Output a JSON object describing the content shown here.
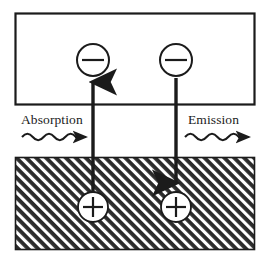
{
  "figure": {
    "width": 269,
    "height": 262,
    "background_color": "#ffffff",
    "ink_color": "#1b1b1b"
  },
  "regions": {
    "conduction_band": {
      "name": "conduction-band-box",
      "fill": "#ffffff",
      "stroke": "#1b1b1b",
      "x": 15,
      "y": 13,
      "width": 240,
      "height": 92
    },
    "valence_band": {
      "name": "valence-band-hatched",
      "fill": "#2b2b2b",
      "hatch_color": "#ffffff",
      "hatch_angle_deg": 45,
      "x": 15,
      "y": 157,
      "width": 240,
      "height": 93
    }
  },
  "carriers": {
    "electrons": [
      {
        "symbol": "−",
        "label": "electron",
        "cx": 93,
        "cy": 60,
        "r": 16
      },
      {
        "symbol": "−",
        "label": "electron",
        "cx": 176,
        "cy": 60,
        "r": 16
      }
    ],
    "holes": [
      {
        "symbol": "+",
        "label": "hole",
        "cx": 93,
        "cy": 207,
        "r": 15
      },
      {
        "symbol": "+",
        "label": "hole",
        "cx": 176,
        "cy": 207,
        "r": 15
      }
    ]
  },
  "transitions": [
    {
      "name": "absorption-transition",
      "direction": "up",
      "x": 93,
      "from_y": 205,
      "to_y": 80
    },
    {
      "name": "emission-transition",
      "direction": "down",
      "x": 176,
      "from_y": 78,
      "to_y": 185
    }
  ],
  "photons": [
    {
      "name": "absorption-photon",
      "label": "Absorption",
      "label_x": 21,
      "label_y": 123,
      "wave_x_start": 22,
      "wave_x_end": 76,
      "wave_y": 137,
      "arrow_tip_x": 88,
      "cycles": 5,
      "amplitude": 5
    },
    {
      "name": "emission-photon",
      "label": "Emission",
      "label_x": 188,
      "label_y": 123,
      "wave_x_start": 185,
      "wave_x_end": 239,
      "wave_y": 137,
      "arrow_tip_x": 251,
      "cycles": 5,
      "amplitude": 5
    }
  ],
  "labels": {
    "absorption": "Absorption",
    "emission": "Emission"
  }
}
